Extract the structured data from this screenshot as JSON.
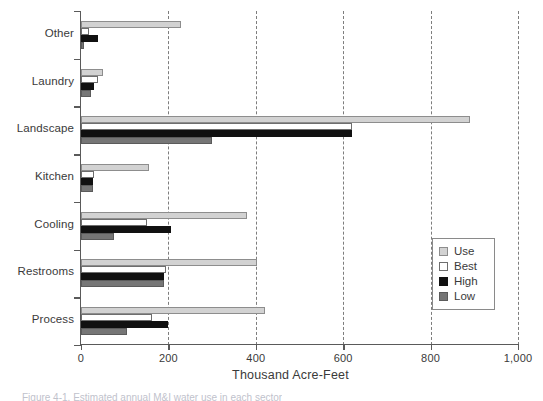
{
  "chart_data": {
    "type": "bar",
    "orientation": "horizontal",
    "title": "",
    "xlabel": "Thousand Acre-Feet",
    "ylabel": "",
    "xlim": [
      0,
      1000
    ],
    "xticks": [
      0,
      200,
      400,
      600,
      800,
      1000
    ],
    "xtick_labels": [
      "0",
      "200",
      "400",
      "600",
      "800",
      "1,000"
    ],
    "grid": "vertical-dashed",
    "legend_position": "right-lower",
    "categories": [
      "Other",
      "Laundry",
      "Landscape",
      "Kitchen",
      "Cooling",
      "Restrooms",
      "Process"
    ],
    "series": [
      {
        "name": "Use",
        "color": "#d2d2d2",
        "values": [
          228,
          50,
          890,
          155,
          380,
          403,
          420
        ]
      },
      {
        "name": "Best",
        "color": "#ffffff",
        "values": [
          18,
          38,
          620,
          30,
          150,
          195,
          162
        ]
      },
      {
        "name": "High",
        "color": "#111111",
        "values": [
          40,
          30,
          620,
          28,
          205,
          190,
          200
        ]
      },
      {
        "name": "Low",
        "color": "#767676",
        "values": [
          6,
          22,
          300,
          27,
          75,
          190,
          105
        ]
      }
    ]
  },
  "legend": {
    "items": [
      {
        "label": "Use",
        "key": "use"
      },
      {
        "label": "Best",
        "key": "best"
      },
      {
        "label": "High",
        "key": "high"
      },
      {
        "label": "Low",
        "key": "low"
      }
    ]
  },
  "axis": {
    "x_title": "Thousand Acre-Feet"
  },
  "caption": {
    "text": "Figure 4-1. Estimated annual M&I water use in each sector"
  }
}
